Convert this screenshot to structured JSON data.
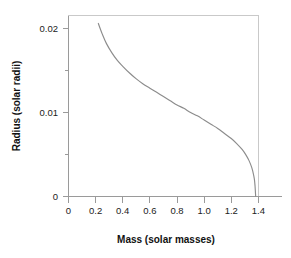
{
  "figure": {
    "background_color": "#ffffff",
    "frame_color": "#c9c9c9",
    "axis_color": "#9a9a9a",
    "curve_color": "#8c8c8c"
  },
  "axes": {
    "x_title": "Mass (solar masses)",
    "y_title": "Radius (solar radii)",
    "x_ticks": [
      "0",
      "0.2",
      "0.4",
      "0.6",
      "0.8",
      "1.0",
      "1.2",
      "1.4"
    ],
    "y_ticks": [
      "0.02",
      "0.01",
      "0"
    ]
  },
  "chart_data": {
    "type": "line",
    "title": "",
    "subtitle": "",
    "xlabel": "Mass (solar masses)",
    "ylabel": "Radius (solar radii)",
    "xlim": [
      0,
      1.5
    ],
    "ylim": [
      0,
      0.022
    ],
    "xticks": [
      0,
      0.2,
      0.4,
      0.6,
      0.8,
      1.0,
      1.2,
      1.4
    ],
    "xticklabels": [
      "0",
      "0.2",
      "0.4",
      "0.6",
      "0.8",
      "1.0",
      "1.2",
      "1.4"
    ],
    "yticks": [
      0,
      0.01,
      0.02
    ],
    "yticklabels": [
      "0",
      "0.01",
      "0.02"
    ],
    "yminorticks": [
      0.005,
      0.015
    ],
    "grid": false,
    "legend": false,
    "legend_position": "none",
    "annotations": [],
    "series": [
      {
        "name": "White dwarf mass-radius relation",
        "color": "#8c8c8c",
        "x": [
          0.22,
          0.25,
          0.28,
          0.32,
          0.36,
          0.4,
          0.45,
          0.5,
          0.55,
          0.6,
          0.65,
          0.7,
          0.75,
          0.8,
          0.85,
          0.9,
          0.95,
          1.0,
          1.05,
          1.1,
          1.15,
          1.2,
          1.24,
          1.28,
          1.31,
          1.33,
          1.35,
          1.36,
          1.37,
          1.375,
          1.38
        ],
        "y": [
          0.0206,
          0.0193,
          0.0182,
          0.0171,
          0.0162,
          0.0155,
          0.0147,
          0.014,
          0.0134,
          0.0129,
          0.0124,
          0.0119,
          0.0114,
          0.0109,
          0.0105,
          0.01,
          0.0096,
          0.0091,
          0.0086,
          0.0081,
          0.0075,
          0.0069,
          0.0063,
          0.0056,
          0.0049,
          0.0043,
          0.0035,
          0.0029,
          0.0021,
          0.0013,
          0.0
        ]
      }
    ]
  }
}
